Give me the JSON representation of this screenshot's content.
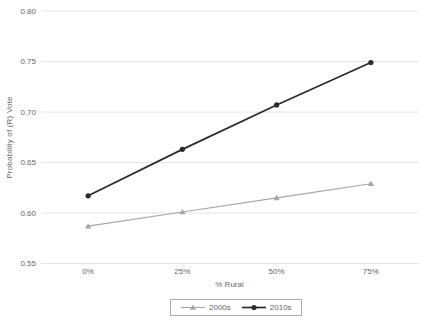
{
  "chart_data": {
    "type": "line",
    "title": "",
    "xlabel": "% Rural",
    "ylabel": "Probability of (R) Vote",
    "categories": [
      "0%",
      "25%",
      "50%",
      "75%"
    ],
    "series": [
      {
        "name": "2000s",
        "values": [
          0.587,
          0.601,
          0.615,
          0.629
        ],
        "color": "#a6a6a6",
        "marker": "triangle",
        "line_width": 1.1
      },
      {
        "name": "2010s",
        "values": [
          0.617,
          0.663,
          0.707,
          0.749
        ],
        "color": "#2b2b2b",
        "marker": "circle",
        "line_width": 1.7
      }
    ],
    "ylim": [
      0.55,
      0.8
    ],
    "ytick_labels": [
      "0.55",
      "0.60",
      "0.65",
      "0.70",
      "0.75",
      "0.80"
    ],
    "ytick_values": [
      0.55,
      0.6,
      0.65,
      0.7,
      0.75,
      0.8
    ],
    "grid": "horizontal-only",
    "legend_position": "bottom-center"
  },
  "colors": {
    "gridline": "#e4e4e4",
    "tick_text": "#666666",
    "background": "#ffffff",
    "legend_border": "#ababab"
  }
}
